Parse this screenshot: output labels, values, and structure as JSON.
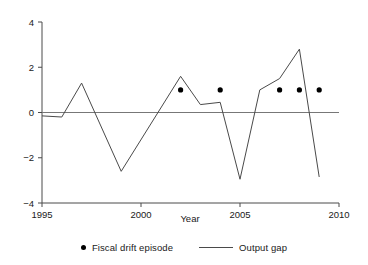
{
  "chart_data": {
    "type": "line",
    "title": "",
    "xlabel": "Year",
    "ylabel": "",
    "xlim": [
      1995,
      2010
    ],
    "ylim": [
      -4,
      4
    ],
    "xticks": [
      1995,
      2000,
      2005,
      2010
    ],
    "xtick_labels": [
      "1995",
      "2000",
      "2005",
      "2010"
    ],
    "yticks": [
      4,
      2,
      0,
      -2,
      -4
    ],
    "ytick_labels": [
      "4",
      "2",
      "0",
      "−2",
      "−4"
    ],
    "grid": false,
    "zero_line": 0,
    "legend_position": "bottom",
    "series": [
      {
        "name": "Output gap",
        "type": "line",
        "color": "#4a4a4a",
        "x": [
          1995,
          1996,
          1997,
          1999,
          2002,
          2003,
          2004,
          2005,
          2006,
          2007,
          2008,
          2009
        ],
        "values": [
          -0.15,
          -0.2,
          1.3,
          -2.6,
          1.6,
          0.35,
          0.45,
          -2.95,
          1.0,
          1.5,
          2.8,
          -2.85
        ]
      },
      {
        "name": "Fiscal drift episode",
        "type": "scatter",
        "color": "#000000",
        "x": [
          2002,
          2004,
          2007,
          2008,
          2009
        ],
        "values": [
          1,
          1,
          1,
          1,
          1
        ]
      }
    ]
  },
  "legend": {
    "entries": [
      {
        "label": "Fiscal drift episode",
        "marker": "dot",
        "color": "#000000"
      },
      {
        "label": "Output gap",
        "marker": "line",
        "color": "#4a4a4a"
      }
    ]
  },
  "axis": {
    "x_title": "Year"
  }
}
